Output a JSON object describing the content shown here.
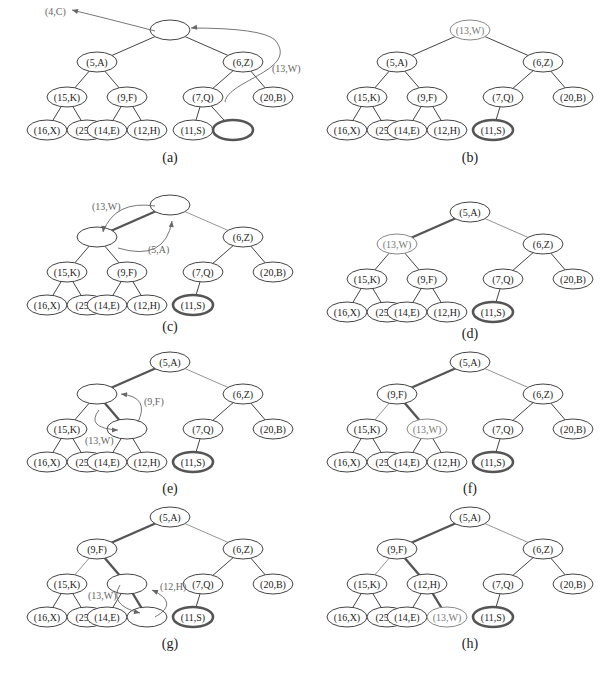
{
  "figure": {
    "layout": {
      "offsets": [
        [
          0,
          0
        ],
        [
          -73,
          32
        ],
        [
          73,
          32
        ],
        [
          -103,
          67
        ],
        [
          -43,
          67
        ],
        [
          33,
          67
        ],
        [
          103,
          67
        ],
        [
          -123,
          100
        ],
        [
          -83,
          100
        ],
        [
          -63,
          100
        ],
        [
          -23,
          100
        ],
        [
          23,
          100
        ],
        [
          63,
          100
        ]
      ],
      "edges": [
        [
          0,
          1
        ],
        [
          0,
          2
        ],
        [
          1,
          3
        ],
        [
          1,
          4
        ],
        [
          2,
          5
        ],
        [
          2,
          6
        ],
        [
          3,
          7
        ],
        [
          3,
          8
        ],
        [
          4,
          9
        ],
        [
          4,
          10
        ],
        [
          5,
          11
        ],
        [
          5,
          12
        ]
      ]
    },
    "panels": [
      {
        "id": "a",
        "label": "(a)",
        "root": [
          170,
          30
        ],
        "label_pos": [
          170,
          162
        ],
        "nodes": [
          "",
          "(5,A)",
          "(6,Z)",
          "(15,K)",
          "(9,F)",
          "(7,Q)",
          "(20,B)",
          "(16,X)",
          "(25,J)",
          "(14,E)",
          "(12,H)",
          "(11,S)",
          ""
        ],
        "thick_nodes": [
          12
        ],
        "light_nodes": [],
        "thick_edges": [],
        "light_edges": [],
        "hidden_edges": [],
        "hidden_nodes": [],
        "annotations": [
          {
            "text": "(4,C)",
            "x": 45,
            "y": 15
          },
          {
            "text": "(13,W)",
            "x": 272,
            "y": 72
          }
        ],
        "arrows": [
          {
            "d": "M 155 31 Q 105 18 72 10",
            "head": [
              72,
              10,
              -8,
              -2
            ]
          },
          {
            "d": "M 225 102 C 228 80 300 70 275 40 Q 262 28 191 28",
            "head": [
              191,
              28,
              -8,
              1
            ]
          }
        ]
      },
      {
        "id": "b",
        "label": "(b)",
        "root": [
          470,
          30
        ],
        "label_pos": [
          470,
          162
        ],
        "nodes": [
          "(13,W)",
          "(5,A)",
          "(6,Z)",
          "(15,K)",
          "(9,F)",
          "(7,Q)",
          "(20,B)",
          "(16,X)",
          "(25,J)",
          "(14,E)",
          "(12,H)",
          "(11,S)",
          ""
        ],
        "thick_nodes": [
          11
        ],
        "light_nodes": [
          0
        ],
        "thick_edges": [],
        "light_edges": [],
        "hidden_edges": [
          [
            5,
            12
          ]
        ],
        "hidden_nodes": [
          12
        ],
        "annotations": [],
        "arrows": []
      },
      {
        "id": "c",
        "label": "(c)",
        "root": [
          170,
          205
        ],
        "label_pos": [
          170,
          331
        ],
        "nodes": [
          "",
          "",
          "(6,Z)",
          "(15,K)",
          "(9,F)",
          "(7,Q)",
          "(20,B)",
          "(16,X)",
          "(25,J)",
          "(14,E)",
          "(12,H)",
          "(11,S)",
          ""
        ],
        "thick_nodes": [
          11
        ],
        "light_nodes": [],
        "thick_edges": [
          [
            0,
            1
          ]
        ],
        "light_edges": [
          [
            0,
            2
          ]
        ],
        "hidden_edges": [
          [
            5,
            12
          ]
        ],
        "hidden_nodes": [
          12
        ],
        "annotations": [
          {
            "text": "(13,W)",
            "x": 92,
            "y": 210
          },
          {
            "text": "(5,A)",
            "x": 148,
            "y": 253
          }
        ],
        "arrows": [
          {
            "d": "M 155 206 Q 115 200 103 232",
            "head": [
              103,
              232,
              -1,
              8
            ]
          },
          {
            "d": "M 118 248 Q 165 262 172 221",
            "head": [
              172,
              221,
              1,
              -8
            ]
          }
        ]
      },
      {
        "id": "d",
        "label": "(d)",
        "root": [
          470,
          212
        ],
        "label_pos": [
          470,
          338
        ],
        "nodes": [
          "(5,A)",
          "(13,W)",
          "(6,Z)",
          "(15,K)",
          "(9,F)",
          "(7,Q)",
          "(20,B)",
          "(16,X)",
          "(25,J)",
          "(14,E)",
          "(12,H)",
          "(11,S)",
          ""
        ],
        "thick_nodes": [
          11
        ],
        "light_nodes": [
          1
        ],
        "thick_edges": [
          [
            0,
            1
          ]
        ],
        "light_edges": [
          [
            0,
            2
          ]
        ],
        "hidden_edges": [
          [
            5,
            12
          ]
        ],
        "hidden_nodes": [
          12
        ],
        "annotations": [],
        "arrows": []
      },
      {
        "id": "e",
        "label": "(e)",
        "root": [
          170,
          362
        ],
        "label_pos": [
          170,
          493
        ],
        "nodes": [
          "(5,A)",
          "",
          "(6,Z)",
          "(15,K)",
          "",
          "(7,Q)",
          "(20,B)",
          "(16,X)",
          "(25,J)",
          "(14,E)",
          "(12,H)",
          "(11,S)",
          ""
        ],
        "thick_nodes": [
          11
        ],
        "light_nodes": [],
        "thick_edges": [
          [
            0,
            1
          ],
          [
            1,
            4
          ]
        ],
        "light_edges": [
          [
            0,
            2
          ]
        ],
        "hidden_edges": [
          [
            5,
            12
          ]
        ],
        "hidden_nodes": [
          12
        ],
        "annotations": [
          {
            "text": "(9,F)",
            "x": 144,
            "y": 405
          },
          {
            "text": "(13,W)",
            "x": 85,
            "y": 444
          }
        ],
        "arrows": [
          {
            "d": "M 138 422 Q 150 397 121 394",
            "head": [
              121,
              394,
              -8,
              -1
            ]
          },
          {
            "d": "M 99 410 Q 85 428 118 430",
            "head": [
              118,
              430,
              8,
              0
            ]
          }
        ]
      },
      {
        "id": "f",
        "label": "(f)",
        "root": [
          470,
          362
        ],
        "label_pos": [
          470,
          493
        ],
        "nodes": [
          "(5,A)",
          "(9,F)",
          "(6,Z)",
          "(15,K)",
          "(13,W)",
          "(7,Q)",
          "(20,B)",
          "(16,X)",
          "(25,J)",
          "(14,E)",
          "(12,H)",
          "(11,S)",
          ""
        ],
        "thick_nodes": [
          11
        ],
        "light_nodes": [
          4
        ],
        "thick_edges": [
          [
            0,
            1
          ],
          [
            1,
            4
          ]
        ],
        "light_edges": [
          [
            0,
            2
          ],
          [
            1,
            3
          ]
        ],
        "hidden_edges": [
          [
            5,
            12
          ]
        ],
        "hidden_nodes": [
          12
        ],
        "annotations": [],
        "arrows": []
      },
      {
        "id": "g",
        "label": "(g)",
        "root": [
          170,
          517
        ],
        "label_pos": [
          170,
          648
        ],
        "nodes": [
          "(5,A)",
          "(9,F)",
          "(6,Z)",
          "(15,K)",
          "",
          "(7,Q)",
          "(20,B)",
          "(16,X)",
          "(25,J)",
          "(14,E)",
          "",
          "(11,S)",
          ""
        ],
        "thick_nodes": [
          11
        ],
        "light_nodes": [],
        "thick_edges": [
          [
            0,
            1
          ],
          [
            1,
            4
          ],
          [
            4,
            10
          ]
        ],
        "light_edges": [
          [
            0,
            2
          ],
          [
            1,
            3
          ]
        ],
        "hidden_edges": [
          [
            5,
            12
          ]
        ],
        "hidden_nodes": [
          12
        ],
        "annotations": [
          {
            "text": "(12,H)",
            "x": 160,
            "y": 590
          },
          {
            "text": "(13,W)",
            "x": 88,
            "y": 599
          }
        ],
        "arrows": [
          {
            "d": "M 155 617 Q 180 603 152 590",
            "head": [
              152,
              590,
              -7,
              -3
            ]
          },
          {
            "d": "M 120 585 Q 108 605 140 613",
            "head": [
              140,
              613,
              8,
              2
            ]
          }
        ]
      },
      {
        "id": "h",
        "label": "(h)",
        "root": [
          470,
          517
        ],
        "label_pos": [
          470,
          648
        ],
        "nodes": [
          "(5,A)",
          "(9,F)",
          "(6,Z)",
          "(15,K)",
          "(12,H)",
          "(7,Q)",
          "(20,B)",
          "(16,X)",
          "(25,J)",
          "(14,E)",
          "(13,W)",
          "(11,S)",
          ""
        ],
        "thick_nodes": [
          11
        ],
        "light_nodes": [
          10
        ],
        "thick_edges": [
          [
            0,
            1
          ],
          [
            1,
            4
          ],
          [
            4,
            10
          ]
        ],
        "light_edges": [
          [
            0,
            2
          ],
          [
            1,
            3
          ]
        ],
        "hidden_edges": [
          [
            5,
            12
          ]
        ],
        "hidden_nodes": [
          12
        ],
        "annotations": [],
        "arrows": []
      }
    ]
  }
}
